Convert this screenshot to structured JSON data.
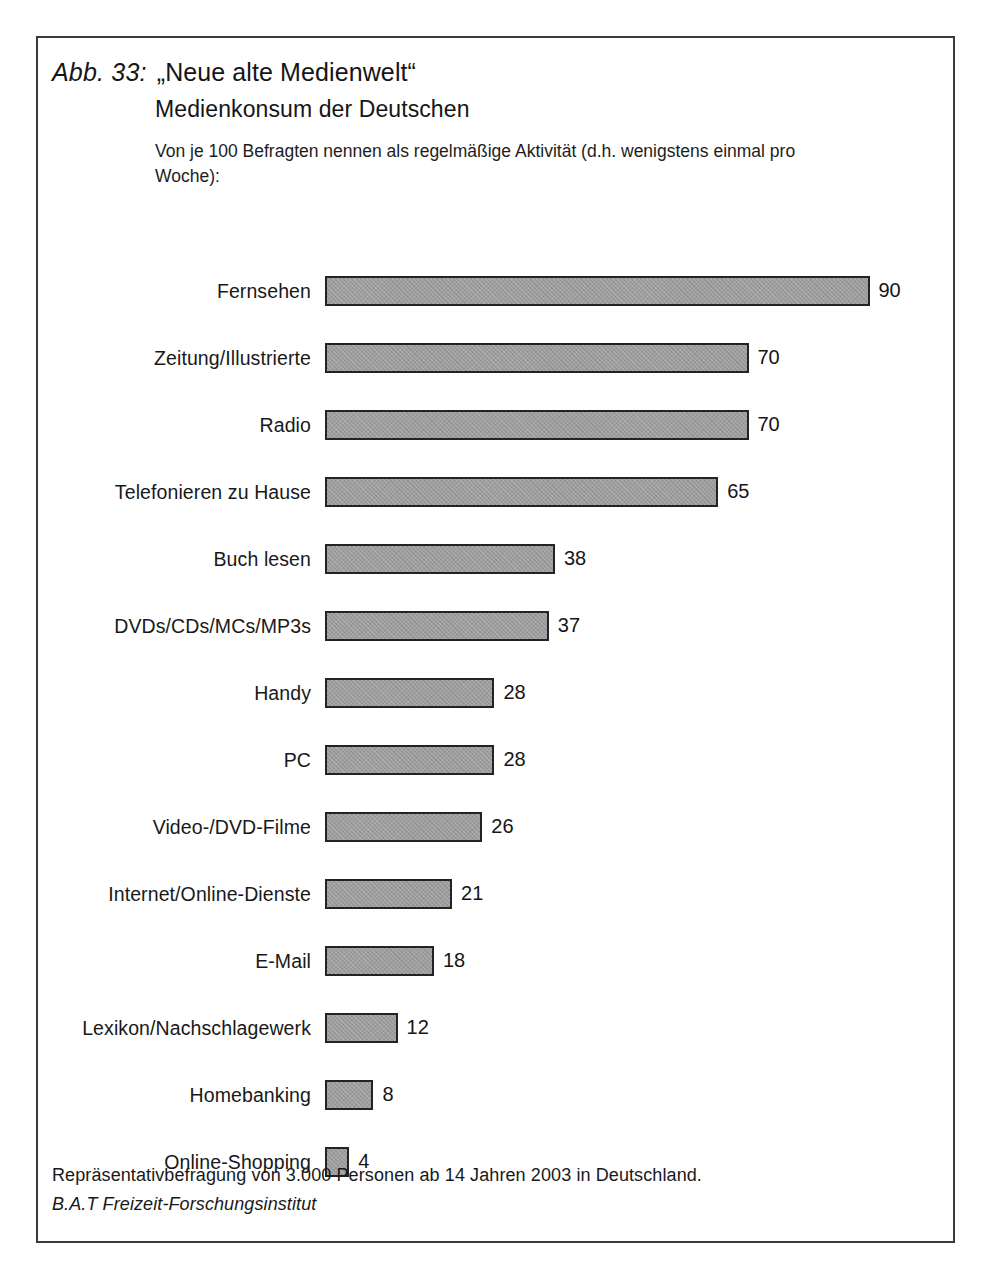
{
  "figure": {
    "number": "Abb. 33:",
    "title": "„Neue alte Medienwelt“",
    "subtitle": "Medienkonsum der Deutschen",
    "note": "Von je 100 Befragten nennen als regelmäßige Aktivität (d.h. wenigstens einmal pro Woche):",
    "footer_line1": "Repräsentativbefragung von 3.000 Personen ab 14 Jahren 2003 in Deutschland.",
    "footer_line2": "B.A.T Freizeit-Forschungsinstitut"
  },
  "style": {
    "bar_fill": "#9b9b9b",
    "bar_border": "#232323",
    "frame_border": "#3a3a3a",
    "text_color": "#191919",
    "px_per_unit": 6.05
  },
  "chart_data": {
    "type": "bar",
    "orientation": "horizontal",
    "subtitle": "Von je 100 Befragten nennen als regelmäßige Aktivität (d.h. wenigstens einmal pro Woche):",
    "xlabel": "",
    "ylabel": "",
    "xlim": [
      0,
      100
    ],
    "grid": false,
    "legend": false,
    "categories": [
      "Fernsehen",
      "Zeitung/Illustrierte",
      "Radio",
      "Telefonieren zu Hause",
      "Buch lesen",
      "DVDs/CDs/MCs/MP3s",
      "Handy",
      "PC",
      "Video-/DVD-Filme",
      "Internet/Online-Dienste",
      "E-Mail",
      "Lexikon/Nachschlagewerk",
      "Homebanking",
      "Online-Shopping"
    ],
    "values": [
      90,
      70,
      70,
      65,
      38,
      37,
      28,
      28,
      26,
      21,
      18,
      12,
      8,
      4
    ],
    "value_labels": [
      "90",
      "70",
      "70",
      "65",
      "38",
      "37",
      "28",
      "28",
      "26",
      "21",
      "18",
      "12",
      "8",
      "4"
    ],
    "source": "Repräsentativbefragung von 3.000 Personen ab 14 Jahren 2003 in Deutschland. B.A.T Freizeit-Forschungsinstitut"
  }
}
